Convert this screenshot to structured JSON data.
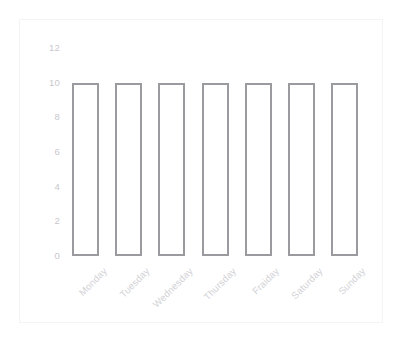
{
  "chart_data": {
    "type": "bar",
    "title": "",
    "subtitle": "",
    "xlabel": "",
    "ylabel": "",
    "categories": [
      "Monday",
      "Tuesday",
      "Wednesday",
      "Thursday",
      "Fraiday",
      "Saturday",
      "Sunday"
    ],
    "values": [
      10,
      10,
      10,
      10,
      10,
      10,
      10
    ],
    "series": [
      {
        "name": "",
        "values": [
          10,
          10,
          10,
          10,
          10,
          10,
          10
        ]
      }
    ],
    "ylim": [
      0,
      12
    ],
    "yticks": [
      0,
      2,
      4,
      6,
      8,
      10,
      12
    ],
    "ytick_labels": [
      "0",
      "2",
      "4",
      "6",
      "8",
      "10",
      "12"
    ],
    "xtick_rotation": -45,
    "grid": false,
    "legend": false,
    "legend_position": "none",
    "bar_style": "outline",
    "colors": {
      "bar_outline": "#9b9b9f",
      "bar_fill": "#ffffff",
      "tick_label": "#c8c8cc",
      "category_label": "#d2d2d6",
      "frame_border": "#f4f4f5",
      "background": "#ffffff"
    }
  }
}
